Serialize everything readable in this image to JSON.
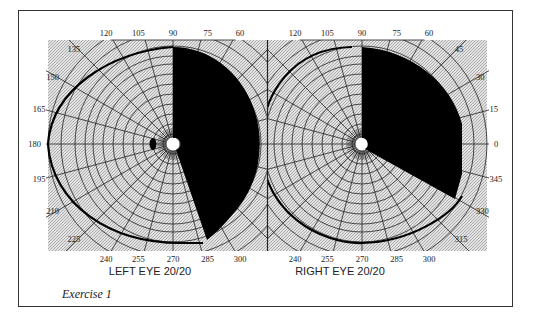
{
  "figure": {
    "caption": "Exercise 1",
    "left_eye": {
      "label": "LEFT EYE",
      "acuity": "20/20",
      "angle_labels": [
        "0",
        "15",
        "30",
        "45",
        "60",
        "75",
        "90",
        "105",
        "120",
        "135",
        "150",
        "165",
        "180",
        "195",
        "210",
        "225",
        "240",
        "255",
        "270",
        "285",
        "300",
        "315",
        "330",
        "345"
      ],
      "visible_angle_labels": [
        "60",
        "75",
        "90",
        "105",
        "120",
        "135",
        "150",
        "165",
        "180",
        "195",
        "210",
        "225",
        "240",
        "255",
        "270",
        "285",
        "300"
      ],
      "defect": "right hemifield blackened from 90 to approx 290 degrees",
      "blind_spot": "small dark oval temporal to fixation at 180 side"
    },
    "right_eye": {
      "label": "RIGHT EYE",
      "acuity": "20/20",
      "visible_angle_labels": [
        "0",
        "15",
        "30",
        "45",
        "60",
        "75",
        "90",
        "105",
        "120",
        "240",
        "255",
        "270",
        "285",
        "300",
        "315",
        "330",
        "345"
      ],
      "defect": "right upper sector blackened from 90 to approx 330 degrees"
    },
    "colors": {
      "field": "#ffffff",
      "defect": "#000000",
      "ring": "#cfcfcf",
      "grid": "#222222"
    }
  }
}
